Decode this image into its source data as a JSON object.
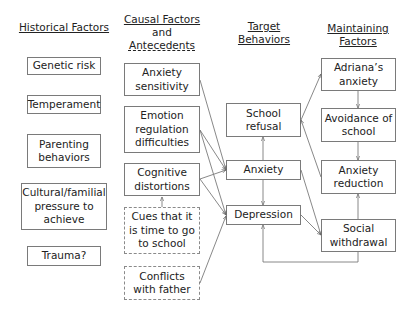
{
  "columns": {
    "historical": {
      "header": "Historical Factors"
    },
    "causal": {
      "header_line1": "Causal Factors",
      "header_line2": "and",
      "header_line3": "Antecedents"
    },
    "target": {
      "header_line1": "Target",
      "header_line2": "Behaviors"
    },
    "maintaining": {
      "header_line1": "Maintaining",
      "header_line2": "Factors"
    }
  },
  "historical_factors": [
    {
      "label": "Genetic risk"
    },
    {
      "label": "Temperament"
    },
    {
      "label": "Parenting behaviors"
    },
    {
      "label": "Cultural/familial pressure to achieve"
    },
    {
      "label": "Trauma?"
    }
  ],
  "causal_factors": [
    {
      "label": "Anxiety sensitivity",
      "style": "solid"
    },
    {
      "label": "Emotion regulation difficulties",
      "style": "solid"
    },
    {
      "label": "Cognitive distortions",
      "style": "solid"
    },
    {
      "label": "Cues that it is time to go to school",
      "style": "dashed"
    },
    {
      "label": "Conflicts with father",
      "style": "dashed"
    }
  ],
  "target_behaviors": [
    {
      "label": "School refusal"
    },
    {
      "label": "Anxiety"
    },
    {
      "label": "Depression"
    }
  ],
  "maintaining_factors": [
    {
      "label": "Adriana’s anxiety"
    },
    {
      "label": "Avoidance of school"
    },
    {
      "label": "Anxiety reduction"
    },
    {
      "label": "Social withdrawal"
    }
  ],
  "edges": [
    {
      "from": "Cues that it is time to go to school",
      "to": "Cognitive distortions"
    },
    {
      "from": "Anxiety sensitivity",
      "to": "Anxiety"
    },
    {
      "from": "Emotion regulation difficulties",
      "to": "Anxiety"
    },
    {
      "from": "Emotion regulation difficulties",
      "to": "Depression"
    },
    {
      "from": "Cognitive distortions",
      "to": "Anxiety"
    },
    {
      "from": "Cognitive distortions",
      "to": "Depression"
    },
    {
      "from": "Conflicts with father",
      "to": "Depression"
    },
    {
      "from": "Anxiety",
      "to": "School refusal"
    },
    {
      "from": "Anxiety",
      "to": "Depression"
    },
    {
      "from": "School refusal",
      "to": "Adriana’s anxiety"
    },
    {
      "from": "Anxiety reduction",
      "to": "School refusal"
    },
    {
      "from": "Adriana’s anxiety",
      "to": "Avoidance of school"
    },
    {
      "from": "Avoidance of school",
      "to": "Anxiety reduction"
    },
    {
      "from": "Anxiety",
      "to": "Social withdrawal"
    },
    {
      "from": "Depression",
      "to": "Social withdrawal"
    },
    {
      "from": "Social withdrawal",
      "to": "Anxiety reduction"
    },
    {
      "from": "Social withdrawal",
      "to": "Depression"
    }
  ]
}
